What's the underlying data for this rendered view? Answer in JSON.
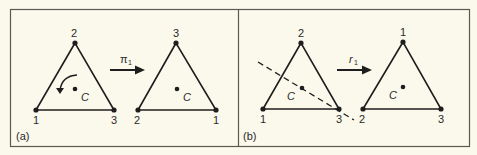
{
  "figure": {
    "panels": [
      {
        "id": "a",
        "label": "(a)",
        "operation": "π",
        "operation_subscript": "1",
        "operation_type": "rotation",
        "before": {
          "top": "2",
          "bottom_left": "1",
          "bottom_right": "3",
          "center": "C"
        },
        "after": {
          "top": "3",
          "bottom_left": "2",
          "bottom_right": "1",
          "center": "C"
        }
      },
      {
        "id": "b",
        "label": "(b)",
        "operation": "r",
        "operation_subscript": "1",
        "operation_type": "reflection",
        "before": {
          "top": "2",
          "bottom_left": "1",
          "bottom_right": "3",
          "center": "C"
        },
        "after": {
          "top": "1",
          "bottom_left": "2",
          "bottom_right": "3",
          "center": "C"
        }
      }
    ],
    "colors": {
      "background": "#fbf8ec",
      "ink": "#1e1e1e",
      "frame": "#5a5a52"
    }
  }
}
